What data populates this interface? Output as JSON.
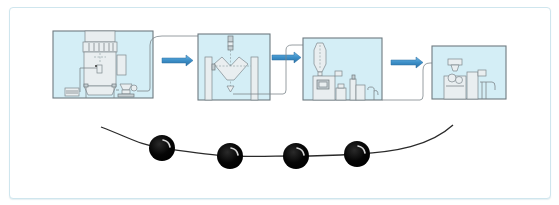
{
  "diagram": {
    "type": "process-flow",
    "frame": {
      "border_color": "#cfe6ee",
      "background": "#ffffff"
    },
    "colors": {
      "panel_fill": "#d4eef6",
      "panel_border": "#6e7a80",
      "arrow_fill": "#3c8fc8",
      "arrow_stroke": "#2a6fa3",
      "bead_fill": "#000000",
      "string_color": "#2a2a2a"
    },
    "stages": [
      {
        "id": "stage-1",
        "icon": "fluid-bed-granulator-icon",
        "x": 53,
        "y": 31,
        "w": 100,
        "h": 67
      },
      {
        "id": "stage-2",
        "icon": "v-blender-icon",
        "x": 198,
        "y": 34,
        "w": 72,
        "h": 66
      },
      {
        "id": "stage-3",
        "icon": "tablet-press-cyclone-icon",
        "x": 303,
        "y": 38,
        "w": 79,
        "h": 62
      },
      {
        "id": "stage-4",
        "icon": "coating-machine-icon",
        "x": 432,
        "y": 46,
        "w": 74,
        "h": 53
      }
    ],
    "arrows": [
      {
        "from": "stage-1",
        "to": "stage-2",
        "x": 162,
        "y": 56,
        "w": 31
      },
      {
        "from": "stage-2",
        "to": "stage-3",
        "x": 272,
        "y": 53,
        "w": 29
      },
      {
        "from": "stage-3",
        "to": "stage-4",
        "x": 391,
        "y": 58,
        "w": 33
      }
    ],
    "bead_string": {
      "start": [
        101,
        127
      ],
      "end": [
        453,
        125
      ],
      "beads": [
        {
          "cx": 162,
          "cy": 148,
          "r": 13
        },
        {
          "cx": 230,
          "cy": 156,
          "r": 13
        },
        {
          "cx": 296,
          "cy": 156,
          "r": 13
        },
        {
          "cx": 357,
          "cy": 154,
          "r": 13
        }
      ]
    }
  }
}
